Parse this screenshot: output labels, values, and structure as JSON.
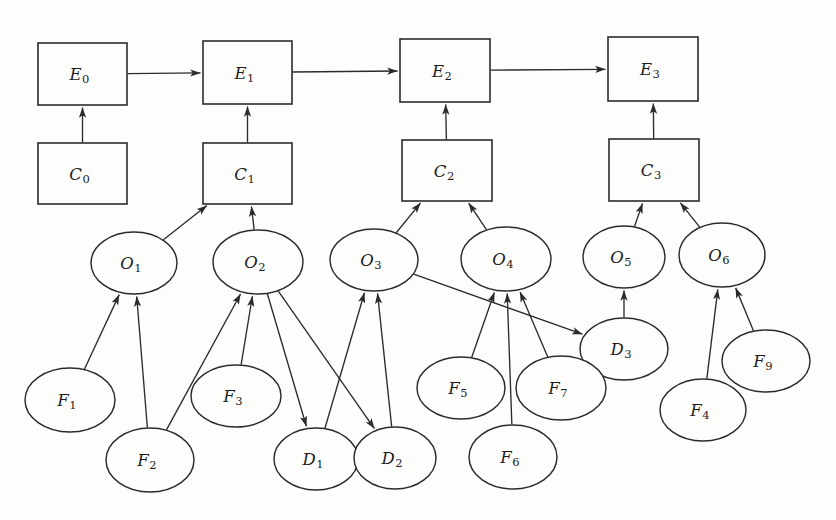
{
  "diagram": {
    "background_color": "#fdfdfc",
    "stroke_color": "#2b2b2b",
    "label_color": "#1c1c1c",
    "width": 836,
    "height": 520,
    "node_shapes": {
      "E": "rectangle",
      "C": "rectangle",
      "O": "ellipse",
      "D": "ellipse",
      "F": "ellipse"
    },
    "nodes": [
      {
        "id": "E0",
        "base": "E",
        "sub": "0",
        "shape": "rect",
        "x": 38,
        "y": 43,
        "w": 89,
        "h": 62
      },
      {
        "id": "E1",
        "base": "E",
        "sub": "1",
        "shape": "rect",
        "x": 203,
        "y": 41,
        "w": 89,
        "h": 63
      },
      {
        "id": "E2",
        "base": "E",
        "sub": "2",
        "shape": "rect",
        "x": 400,
        "y": 39,
        "w": 90,
        "h": 63
      },
      {
        "id": "E3",
        "base": "E",
        "sub": "3",
        "shape": "rect",
        "x": 608,
        "y": 37,
        "w": 90,
        "h": 64
      },
      {
        "id": "C0",
        "base": "C",
        "sub": "0",
        "shape": "rect",
        "x": 38,
        "y": 143,
        "w": 89,
        "h": 61
      },
      {
        "id": "C1",
        "base": "C",
        "sub": "1",
        "shape": "rect",
        "x": 203,
        "y": 143,
        "w": 89,
        "h": 61
      },
      {
        "id": "C2",
        "base": "C",
        "sub": "2",
        "shape": "rect",
        "x": 402,
        "y": 140,
        "w": 90,
        "h": 61
      },
      {
        "id": "C3",
        "base": "C",
        "sub": "3",
        "shape": "rect",
        "x": 609,
        "y": 139,
        "w": 90,
        "h": 62
      },
      {
        "id": "O1",
        "base": "O",
        "sub": "1",
        "shape": "ellipse",
        "cx": 134,
        "cy": 263,
        "rx": 43,
        "ry": 31
      },
      {
        "id": "O2",
        "base": "O",
        "sub": "2",
        "shape": "ellipse",
        "cx": 258,
        "cy": 262,
        "rx": 45,
        "ry": 32
      },
      {
        "id": "O3",
        "base": "O",
        "sub": "3",
        "shape": "ellipse",
        "cx": 374,
        "cy": 260,
        "rx": 44,
        "ry": 31
      },
      {
        "id": "O4",
        "base": "O",
        "sub": "4",
        "shape": "ellipse",
        "cx": 506,
        "cy": 259,
        "rx": 45,
        "ry": 32
      },
      {
        "id": "O5",
        "base": "O",
        "sub": "5",
        "shape": "ellipse",
        "cx": 624,
        "cy": 257,
        "rx": 41,
        "ry": 31
      },
      {
        "id": "O6",
        "base": "O",
        "sub": "6",
        "shape": "ellipse",
        "cx": 722,
        "cy": 255,
        "rx": 43,
        "ry": 32
      },
      {
        "id": "D1",
        "base": "D",
        "sub": "1",
        "shape": "ellipse",
        "cx": 316,
        "cy": 459,
        "rx": 42,
        "ry": 31
      },
      {
        "id": "D2",
        "base": "D",
        "sub": "2",
        "shape": "ellipse",
        "cx": 395,
        "cy": 458,
        "rx": 41,
        "ry": 31
      },
      {
        "id": "D3",
        "base": "D",
        "sub": "3",
        "shape": "ellipse",
        "cx": 624,
        "cy": 349,
        "rx": 44,
        "ry": 31
      },
      {
        "id": "F1",
        "base": "F",
        "sub": "1",
        "shape": "ellipse",
        "cx": 70,
        "cy": 400,
        "rx": 45,
        "ry": 32
      },
      {
        "id": "F2",
        "base": "F",
        "sub": "2",
        "shape": "ellipse",
        "cx": 150,
        "cy": 460,
        "rx": 44,
        "ry": 32
      },
      {
        "id": "F3",
        "base": "F",
        "sub": "3",
        "shape": "ellipse",
        "cx": 236,
        "cy": 396,
        "rx": 45,
        "ry": 31
      },
      {
        "id": "F4",
        "base": "F",
        "sub": "4",
        "shape": "ellipse",
        "cx": 703,
        "cy": 410,
        "rx": 43,
        "ry": 31
      },
      {
        "id": "F5",
        "base": "F",
        "sub": "5",
        "shape": "ellipse",
        "cx": 461,
        "cy": 388,
        "rx": 44,
        "ry": 31
      },
      {
        "id": "F6",
        "base": "F",
        "sub": "6",
        "shape": "ellipse",
        "cx": 513,
        "cy": 457,
        "rx": 44,
        "ry": 32
      },
      {
        "id": "F7",
        "base": "F",
        "sub": "7",
        "shape": "ellipse",
        "cx": 561,
        "cy": 388,
        "rx": 45,
        "ry": 32
      },
      {
        "id": "F9",
        "base": "F",
        "sub": "9",
        "shape": "ellipse",
        "cx": 766,
        "cy": 361,
        "rx": 44,
        "ry": 31
      }
    ],
    "edges": [
      {
        "from": "E0",
        "to": "E1",
        "kind": "event-chain"
      },
      {
        "from": "E1",
        "to": "E2",
        "kind": "event-chain"
      },
      {
        "from": "E2",
        "to": "E3",
        "kind": "event-chain"
      },
      {
        "from": "C0",
        "to": "E0",
        "kind": "context-to-event"
      },
      {
        "from": "C1",
        "to": "E1",
        "kind": "context-to-event"
      },
      {
        "from": "C2",
        "to": "E2",
        "kind": "context-to-event"
      },
      {
        "from": "C3",
        "to": "E3",
        "kind": "context-to-event"
      },
      {
        "from": "O1",
        "to": "C1",
        "kind": "observation-to-context"
      },
      {
        "from": "O2",
        "to": "C1",
        "kind": "observation-to-context"
      },
      {
        "from": "O3",
        "to": "C2",
        "kind": "observation-to-context"
      },
      {
        "from": "O4",
        "to": "C2",
        "kind": "observation-to-context"
      },
      {
        "from": "O5",
        "to": "C3",
        "kind": "observation-to-context"
      },
      {
        "from": "O6",
        "to": "C3",
        "kind": "observation-to-context"
      },
      {
        "from": "F1",
        "to": "O1",
        "kind": "feature-to-observation"
      },
      {
        "from": "F2",
        "to": "O1",
        "kind": "feature-to-observation"
      },
      {
        "from": "F2",
        "to": "O2",
        "kind": "feature-to-observation"
      },
      {
        "from": "F3",
        "to": "O2",
        "kind": "feature-to-observation"
      },
      {
        "from": "F5",
        "to": "O4",
        "kind": "feature-to-observation"
      },
      {
        "from": "F6",
        "to": "O4",
        "kind": "feature-to-observation"
      },
      {
        "from": "F7",
        "to": "O4",
        "kind": "feature-to-observation"
      },
      {
        "from": "F4",
        "to": "O6",
        "kind": "feature-to-observation"
      },
      {
        "from": "F9",
        "to": "O6",
        "kind": "feature-to-observation"
      },
      {
        "from": "O2",
        "to": "D1",
        "kind": "observation-to-derived"
      },
      {
        "from": "O2",
        "to": "D2",
        "kind": "observation-to-derived"
      },
      {
        "from": "O3",
        "to": "D3",
        "kind": "observation-to-derived"
      },
      {
        "from": "D1",
        "to": "O3",
        "kind": "derived-to-observation"
      },
      {
        "from": "D2",
        "to": "O3",
        "kind": "derived-to-observation"
      },
      {
        "from": "D3",
        "to": "O5",
        "kind": "derived-to-observation"
      }
    ]
  }
}
